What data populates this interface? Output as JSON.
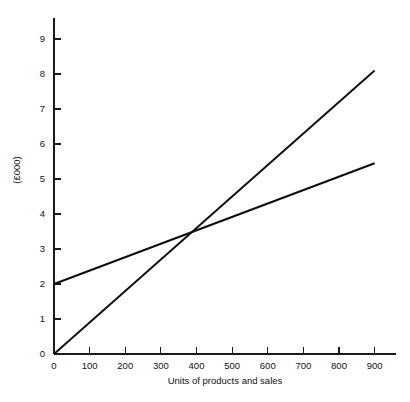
{
  "chart_data": {
    "type": "line",
    "title": "",
    "xlabel": "Units of products and sales",
    "ylabel": "(£000)",
    "xlim": [
      0,
      960
    ],
    "ylim": [
      0,
      9.6
    ],
    "grid": false,
    "legend": "none",
    "x_ticks": [
      0,
      100,
      200,
      300,
      400,
      500,
      600,
      700,
      800,
      900
    ],
    "x_tick_labels": [
      "0",
      "100",
      "200",
      "300",
      "400",
      "500",
      "600",
      "700",
      "800",
      "900"
    ],
    "y_ticks": [
      0,
      1,
      2,
      3,
      4,
      5,
      6,
      7,
      8,
      9
    ],
    "y_tick_labels": [
      "0",
      "1",
      "2",
      "3",
      "4",
      "5",
      "6",
      "7",
      "8",
      "9"
    ],
    "series": [
      {
        "name": "sales-revenue-line",
        "points": [
          [
            0,
            0
          ],
          [
            900,
            8.1
          ]
        ],
        "color": "#0d0d0d"
      },
      {
        "name": "total-cost-line",
        "points": [
          [
            0,
            2.0
          ],
          [
            900,
            5.45
          ]
        ],
        "color": "#0d0d0d"
      }
    ],
    "intersection": {
      "x": 390,
      "y": 3.45
    }
  },
  "axes": {
    "x_title": "Units of products and sales",
    "y_title": "(£000)"
  }
}
